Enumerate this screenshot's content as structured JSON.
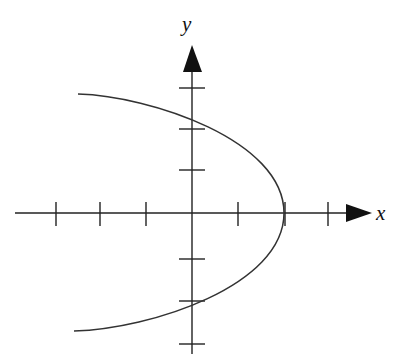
{
  "diagram": {
    "type": "coordinate-graph",
    "cut_off_header_text": "graph of ... ",
    "axes": {
      "x_label": "x",
      "y_label": "y",
      "x_ticks_count": 6,
      "y_ticks_count": 6,
      "arrow_style": "filled-triangle"
    },
    "curve": {
      "shape": "parabola",
      "opens": "left",
      "vertex_tick_index": 3,
      "vertex": [
        3,
        0
      ],
      "y_intercepts_approx": [
        2.3,
        -2.3
      ]
    },
    "colors": {
      "axis": "#222222",
      "curve": "#333333",
      "background": "#ffffff"
    }
  }
}
